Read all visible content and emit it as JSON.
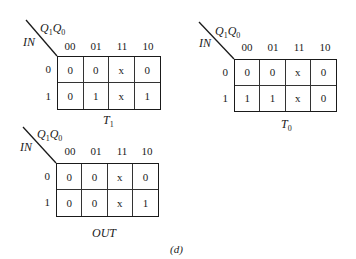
{
  "figure_label": "(d)",
  "maps": [
    {
      "id": "T1",
      "caption_main": "T",
      "caption_sub": "1",
      "row_var": "IN",
      "col_var_a": "Q",
      "col_var_a_sub": "1",
      "col_var_b": "Q",
      "col_var_b_sub": "0",
      "col_headers": [
        "00",
        "01",
        "11",
        "10"
      ],
      "row_headers": [
        "0",
        "1"
      ],
      "cells": [
        [
          "0",
          "0",
          "x",
          "0"
        ],
        [
          "0",
          "1",
          "x",
          "1"
        ]
      ]
    },
    {
      "id": "T0",
      "caption_main": "T",
      "caption_sub": "0",
      "row_var": "IN",
      "col_var_a": "Q",
      "col_var_a_sub": "1",
      "col_var_b": "Q",
      "col_var_b_sub": "0",
      "col_headers": [
        "00",
        "01",
        "11",
        "10"
      ],
      "row_headers": [
        "0",
        "1"
      ],
      "cells": [
        [
          "0",
          "0",
          "x",
          "0"
        ],
        [
          "1",
          "1",
          "x",
          "0"
        ]
      ]
    },
    {
      "id": "OUT",
      "caption_main": "OUT",
      "caption_sub": "",
      "row_var": "IN",
      "col_var_a": "Q",
      "col_var_a_sub": "1",
      "col_var_b": "Q",
      "col_var_b_sub": "0",
      "col_headers": [
        "00",
        "01",
        "11",
        "10"
      ],
      "row_headers": [
        "0",
        "1"
      ],
      "cells": [
        [
          "0",
          "0",
          "x",
          "0"
        ],
        [
          "0",
          "0",
          "x",
          "1"
        ]
      ]
    }
  ]
}
